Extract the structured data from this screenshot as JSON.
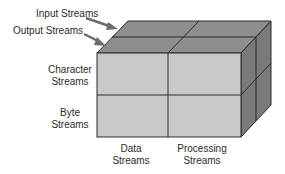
{
  "diagram": {
    "type": "3d-cube-matrix",
    "colors": {
      "front_face": "#c9c9c9",
      "top_face": "#8e8e8e",
      "right_face": "#7a7a7a",
      "edges": "#2b2b2b",
      "arrow": "#6b6b6b",
      "text": "#2a2a2a"
    },
    "depth_labels": [
      {
        "line1": "Input Streams"
      },
      {
        "line1": "Output Streams"
      }
    ],
    "row_labels": [
      {
        "line1": "Character",
        "line2": "Streams"
      },
      {
        "line1": "Byte",
        "line2": "Streams"
      }
    ],
    "column_labels": [
      {
        "line1": "Data",
        "line2": "Streams"
      },
      {
        "line1": "Processing",
        "line2": "Streams"
      }
    ]
  }
}
